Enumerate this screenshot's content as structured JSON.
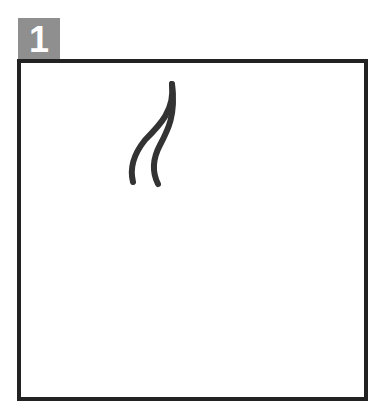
{
  "panel": {
    "number_label": "1",
    "badge_color": "#8f8f8f",
    "frame_color": "#222222",
    "drawing": {
      "description": "two curved hand-drawn strokes",
      "stroke_color": "#333333"
    }
  }
}
